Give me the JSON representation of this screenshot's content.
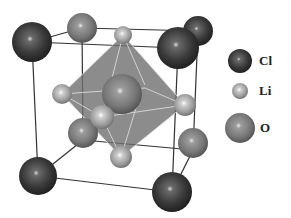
{
  "colors": {
    "Cl": "#3a3a3a",
    "Li": "#a9a9a9",
    "O": "#7c7c7c",
    "octahedron": "#6f6f6f",
    "edge": "#333333",
    "bond": "#e6e6e6"
  },
  "legend": [
    {
      "element": "Cl",
      "label": "Cl",
      "cx": 240,
      "cy": 61,
      "r": 12,
      "label_x": 259,
      "label_y": 53
    },
    {
      "element": "Li",
      "label": "Li",
      "cx": 240,
      "cy": 91,
      "r": 8,
      "label_x": 259,
      "label_y": 83
    },
    {
      "element": "O",
      "label": "O",
      "cx": 240,
      "cy": 128,
      "r": 15,
      "label_x": 260,
      "label_y": 120
    }
  ],
  "cube_edges": [
    [
      32,
      42,
      178,
      48
    ],
    [
      178,
      48,
      172,
      192
    ],
    [
      172,
      192,
      38,
      176
    ],
    [
      38,
      176,
      32,
      42
    ],
    [
      82,
      28,
      198,
      31
    ],
    [
      198,
      31,
      193,
      150
    ],
    [
      193,
      150,
      83,
      140
    ],
    [
      83,
      140,
      82,
      28
    ],
    [
      32,
      42,
      82,
      28
    ],
    [
      178,
      48,
      198,
      31
    ],
    [
      172,
      192,
      193,
      150
    ],
    [
      38,
      176,
      83,
      140
    ]
  ],
  "octahedron": {
    "faces": [
      "123,35 62,94 102,117",
      "123,35 102,117 185,105",
      "62,94 102,117 121,157",
      "102,117 185,105 121,157",
      "123,35 62,94 140,90 185,105",
      "62,94 121,157 185,105 140,90"
    ],
    "bonds": [
      [
        123,
        35,
        102,
        117
      ],
      [
        123,
        35,
        62,
        94
      ],
      [
        123,
        35,
        185,
        105
      ],
      [
        123,
        35,
        145,
        85
      ],
      [
        62,
        94,
        102,
        117
      ],
      [
        102,
        117,
        185,
        105
      ],
      [
        62,
        94,
        145,
        88
      ],
      [
        145,
        88,
        185,
        105
      ],
      [
        121,
        157,
        102,
        117
      ],
      [
        121,
        157,
        62,
        94
      ],
      [
        121,
        157,
        185,
        105
      ],
      [
        121,
        157,
        140,
        95
      ]
    ]
  },
  "atoms": [
    {
      "element": "O",
      "cx": 82,
      "cy": 28,
      "r": 15
    },
    {
      "element": "Cl",
      "cx": 198,
      "cy": 31,
      "r": 15
    },
    {
      "element": "O",
      "cx": 193,
      "cy": 143,
      "r": 15
    },
    {
      "element": "Li",
      "cx": 123,
      "cy": 35,
      "r": 9
    },
    {
      "element": "Li",
      "cx": 62,
      "cy": 94,
      "r": 10
    },
    {
      "element": "O",
      "cx": 122,
      "cy": 94,
      "r": 20
    },
    {
      "element": "Li",
      "cx": 185,
      "cy": 105,
      "r": 11
    },
    {
      "element": "O",
      "cx": 83,
      "cy": 133,
      "r": 15
    },
    {
      "element": "Li",
      "cx": 102,
      "cy": 117,
      "r": 12
    },
    {
      "element": "Li",
      "cx": 121,
      "cy": 157,
      "r": 11
    },
    {
      "element": "Cl",
      "cx": 32,
      "cy": 42,
      "r": 20
    },
    {
      "element": "Cl",
      "cx": 178,
      "cy": 48,
      "r": 21
    },
    {
      "element": "Cl",
      "cx": 38,
      "cy": 176,
      "r": 19
    },
    {
      "element": "Cl",
      "cx": 172,
      "cy": 192,
      "r": 20
    }
  ]
}
